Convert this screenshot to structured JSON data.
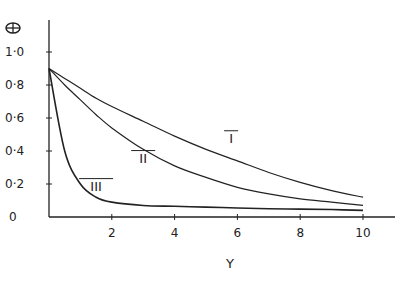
{
  "chart_data": {
    "type": "line",
    "title": "",
    "xlabel": "Y",
    "ylabel": "Θ",
    "xlim": [
      0,
      10
    ],
    "ylim": [
      0,
      1.0
    ],
    "xticks": [
      "2",
      "4",
      "6",
      "8",
      "10"
    ],
    "yticks": [
      "0",
      "0·2",
      "0·4",
      "0·6",
      "0·8",
      "1·0"
    ],
    "grid": false,
    "x": [
      0,
      0.5,
      1,
      1.5,
      2,
      3,
      4,
      5,
      6,
      7,
      8,
      9,
      10
    ],
    "series": [
      {
        "name": "I",
        "values": [
          0.9,
          0.84,
          0.78,
          0.72,
          0.67,
          0.58,
          0.49,
          0.41,
          0.34,
          0.27,
          0.21,
          0.16,
          0.12
        ]
      },
      {
        "name": "II",
        "values": [
          0.9,
          0.8,
          0.71,
          0.62,
          0.54,
          0.41,
          0.31,
          0.24,
          0.18,
          0.14,
          0.11,
          0.09,
          0.07
        ]
      },
      {
        "name": "III",
        "values": [
          0.9,
          0.4,
          0.2,
          0.12,
          0.09,
          0.07,
          0.065,
          0.06,
          0.055,
          0.05,
          0.048,
          0.045,
          0.04
        ]
      }
    ],
    "annotations": [
      {
        "text": "I",
        "x": 5.8,
        "y": 0.45
      },
      {
        "text": "II",
        "x": 3.0,
        "y": 0.33
      },
      {
        "text": "III",
        "x": 1.5,
        "y": 0.16
      }
    ]
  }
}
